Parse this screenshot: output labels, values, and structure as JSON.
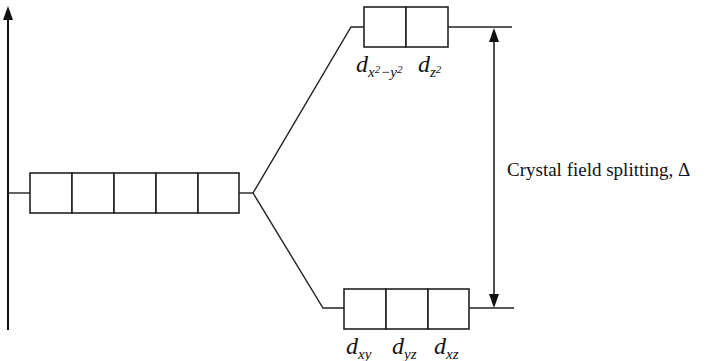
{
  "diagram": {
    "energy_axis": {
      "direction": "up",
      "label": ""
    },
    "levels": {
      "degenerate": {
        "orbital_count": 5,
        "labels": []
      },
      "eg": {
        "orbital_count": 2,
        "labels": [
          {
            "d": "d",
            "sub": "x",
            "sup1": "2",
            "minus": "−",
            "sub2": "y",
            "sup2": "2"
          },
          {
            "d": "d",
            "sub": "z",
            "sup1": "2"
          }
        ]
      },
      "t2g": {
        "orbital_count": 3,
        "labels": [
          {
            "d": "d",
            "sub": "xy"
          },
          {
            "d": "d",
            "sub": "yz"
          },
          {
            "d": "d",
            "sub": "xz"
          }
        ]
      }
    },
    "splitting_annotation": "Crystal field splitting, Δ",
    "colors": {
      "ink": "#222222",
      "background": "#ffffff"
    }
  }
}
